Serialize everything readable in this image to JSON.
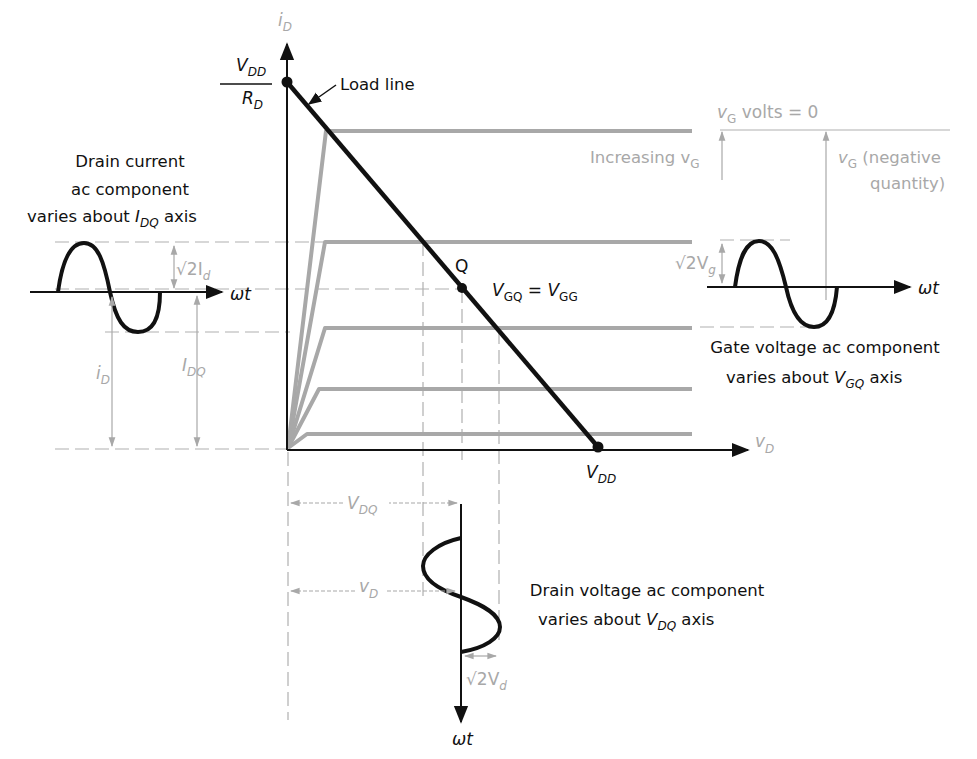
{
  "diagram": {
    "colors": {
      "foreground": "#111111",
      "curves": "#a8a8a8",
      "annotation": "#a8a8a8",
      "background": "#ffffff"
    },
    "axes": {
      "y_label": "i",
      "y_label_sub": "D",
      "x_label": "v",
      "x_label_sub": "D",
      "y_intercept_num": "V",
      "y_intercept_num_sub": "DD",
      "y_intercept_den": "R",
      "y_intercept_den_sub": "D",
      "x_intercept": "V",
      "x_intercept_sub": "DD"
    },
    "load_line": {
      "label": "Load line"
    },
    "q_point": {
      "label": "Q",
      "eq_left": "V",
      "eq_left_sub": "GQ",
      "eq_mid": " = ",
      "eq_right": "V",
      "eq_right_sub": "GG"
    },
    "gate_annotations": {
      "zero_label": "v",
      "zero_label_sub": "G",
      "zero_label_rest": " volts = 0",
      "increasing": "Increasing v",
      "increasing_sub": "G",
      "negative_1": "v",
      "negative_1_sub": "G",
      "negative_1_rest": " (negative",
      "negative_2": "quantity)"
    },
    "drain_current": {
      "caption_1": "Drain current",
      "caption_2": "ac component",
      "caption_3": "varies about ",
      "caption_3_sym": "I",
      "caption_3_sub": "DQ",
      "caption_3_rest": " axis",
      "time_axis": "ωt",
      "amp_label": "√2I",
      "amp_label_sub": "d",
      "total_label": "i",
      "total_label_sub": "D",
      "dc_label": "I",
      "dc_label_sub": "DQ"
    },
    "gate_voltage": {
      "caption_1": "Gate voltage ac component",
      "caption_2": "varies about ",
      "caption_2_sym": "V",
      "caption_2_sub": "GQ",
      "caption_2_rest": " axis",
      "time_axis": "ωt",
      "amp_label": "√2V",
      "amp_label_sub": "g"
    },
    "drain_voltage": {
      "caption_1": "Drain voltage ac component",
      "caption_2": "varies about ",
      "caption_2_sym": "V",
      "caption_2_sub": "DQ",
      "caption_2_rest": " axis",
      "time_axis": "ωt",
      "dc_label": "V",
      "dc_label_sub": "DQ",
      "total_label": "v",
      "total_label_sub": "D",
      "amp_label": "√2V",
      "amp_label_sub": "d"
    }
  }
}
